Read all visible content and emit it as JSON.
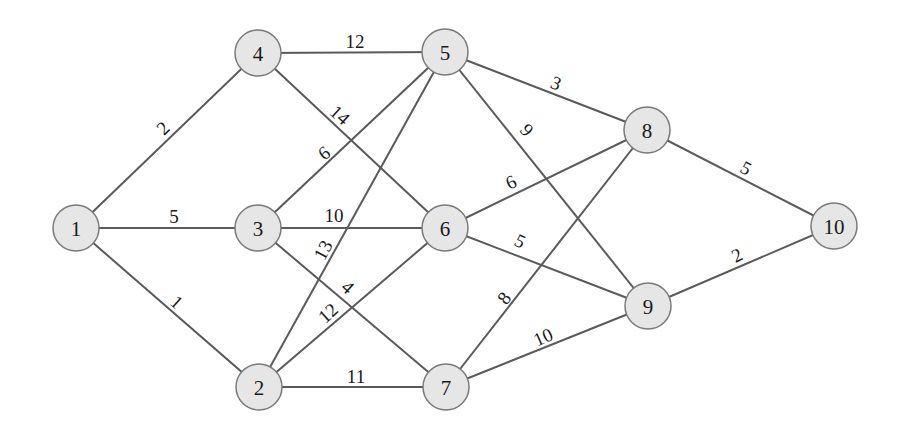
{
  "graph": {
    "nodes": [
      {
        "id": "1",
        "label": "1",
        "x": 76,
        "y": 228
      },
      {
        "id": "2",
        "label": "2",
        "x": 259,
        "y": 387
      },
      {
        "id": "3",
        "label": "3",
        "x": 258,
        "y": 228
      },
      {
        "id": "4",
        "label": "4",
        "x": 258,
        "y": 53
      },
      {
        "id": "5",
        "label": "5",
        "x": 445,
        "y": 52
      },
      {
        "id": "6",
        "label": "6",
        "x": 445,
        "y": 228
      },
      {
        "id": "7",
        "label": "7",
        "x": 446,
        "y": 387
      },
      {
        "id": "8",
        "label": "8",
        "x": 647,
        "y": 130
      },
      {
        "id": "9",
        "label": "9",
        "x": 648,
        "y": 306
      },
      {
        "id": "10",
        "label": "10",
        "x": 834,
        "y": 226
      }
    ],
    "edges": [
      {
        "from": "1",
        "to": "4",
        "weight": "2",
        "lx": 163,
        "ly": 128,
        "rot": -44
      },
      {
        "from": "1",
        "to": "3",
        "weight": "5",
        "lx": 174,
        "ly": 216,
        "rot": 0
      },
      {
        "from": "1",
        "to": "2",
        "weight": "1",
        "lx": 177,
        "ly": 302,
        "rot": 42
      },
      {
        "from": "4",
        "to": "5",
        "weight": "12",
        "lx": 355,
        "ly": 41,
        "rot": 0
      },
      {
        "from": "4",
        "to": "6",
        "weight": "14",
        "lx": 340,
        "ly": 115,
        "rot": 42
      },
      {
        "from": "3",
        "to": "5",
        "weight": "6",
        "lx": 324,
        "ly": 153,
        "rot": -38
      },
      {
        "from": "3",
        "to": "6",
        "weight": "10",
        "lx": 334,
        "ly": 215,
        "rot": 0
      },
      {
        "from": "3",
        "to": "7",
        "weight": "4",
        "lx": 348,
        "ly": 287,
        "rot": 42
      },
      {
        "from": "2",
        "to": "5",
        "weight": "13",
        "lx": 323,
        "ly": 250,
        "rot": -62
      },
      {
        "from": "2",
        "to": "6",
        "weight": "12",
        "lx": 328,
        "ly": 313,
        "rot": -42
      },
      {
        "from": "2",
        "to": "7",
        "weight": "11",
        "lx": 356,
        "ly": 376,
        "rot": 0
      },
      {
        "from": "5",
        "to": "8",
        "weight": "3",
        "lx": 556,
        "ly": 83,
        "rot": 22
      },
      {
        "from": "5",
        "to": "9",
        "weight": "9",
        "lx": 527,
        "ly": 130,
        "rot": 48
      },
      {
        "from": "6",
        "to": "8",
        "weight": "6",
        "lx": 511,
        "ly": 182,
        "rot": -26
      },
      {
        "from": "6",
        "to": "9",
        "weight": "5",
        "lx": 520,
        "ly": 241,
        "rot": 26
      },
      {
        "from": "7",
        "to": "8",
        "weight": "8",
        "lx": 504,
        "ly": 298,
        "rot": -52
      },
      {
        "from": "7",
        "to": "9",
        "weight": "10",
        "lx": 543,
        "ly": 337,
        "rot": -24
      },
      {
        "from": "8",
        "to": "10",
        "weight": "5",
        "lx": 746,
        "ly": 168,
        "rot": 28
      },
      {
        "from": "9",
        "to": "10",
        "weight": "2",
        "lx": 737,
        "ly": 255,
        "rot": -26
      }
    ]
  },
  "style": {
    "node_fill": "#e6e6e6",
    "node_stroke": "#7a7a7a",
    "edge_color": "#5a5a5a",
    "node_radius": 23
  }
}
